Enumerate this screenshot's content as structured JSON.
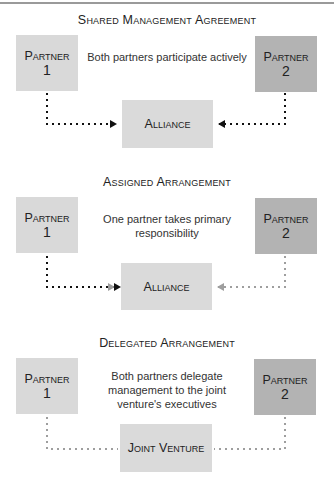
{
  "sections": [
    {
      "title": "Shared Management Agreement",
      "description": "Both partners participate actively",
      "partner1": {
        "label": "Partner",
        "number": "1"
      },
      "partner2": {
        "label": "Partner",
        "number": "2"
      },
      "center": "Alliance",
      "partner1_link": "dark-dotted-arrow",
      "partner2_link": "dark-dotted-arrow"
    },
    {
      "title": "Assigned Arrangement",
      "description": "One partner takes primary responsibility",
      "partner1": {
        "label": "Partner",
        "number": "1"
      },
      "partner2": {
        "label": "Partner",
        "number": "2"
      },
      "center": "Alliance",
      "partner1_link": "dark-dotted-arrow",
      "partner2_link": "light-dotted-arrow"
    },
    {
      "title": "Delegated Arrangement",
      "description": "Both partners delegate management to the joint venture's executives",
      "partner1": {
        "label": "Partner",
        "number": "1"
      },
      "partner2": {
        "label": "Partner",
        "number": "2"
      },
      "center": "Joint Venture",
      "partner1_link": "light-dotted-line",
      "partner2_link": "light-dotted-line"
    }
  ],
  "colors": {
    "partner1_fill": "#d9d9d9",
    "partner2_fill": "#b3b3b3",
    "center_fill": "#dadada",
    "dark_line": "#111111",
    "light_line": "#9e9e9e"
  }
}
